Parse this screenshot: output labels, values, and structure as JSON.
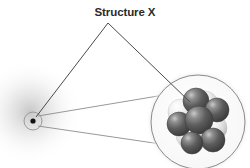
{
  "figure": {
    "title": "Structure X",
    "background_color": "#ffffff",
    "label_color": "#2b2b2b",
    "line_color": "#5a5a5a",
    "callout_line_color": "#4a4a4a",
    "magnifier_line_color": "#8c8c8c"
  },
  "atom": {
    "name": "atom",
    "electron_cloud": {
      "name": "electron-cloud",
      "center_x": 30,
      "center_y": 112,
      "radius": 52,
      "color": "#b8b8b8",
      "opacity": 0.55
    },
    "shell": {
      "name": "atom-outline-circle",
      "center_x": 33,
      "center_y": 121,
      "radius": 9,
      "stroke": "#9a9a9a",
      "stroke_width": 1
    },
    "nucleus_dot": {
      "name": "nucleus-dot",
      "center_x": 33,
      "center_y": 121,
      "radius": 2.6,
      "fill": "#111111"
    }
  },
  "magnifier": {
    "name": "magnified-nucleus",
    "circle": {
      "center_x": 198,
      "center_y": 122,
      "radius": 47,
      "stroke": "#8c8c8c",
      "stroke_width": 1,
      "fill": "#ffffff"
    },
    "halo_color": "#e9e9e9",
    "cone_lines": [
      {
        "x1": 38,
        "y1": 116,
        "x2": 176,
        "y2": 93
      },
      {
        "x1": 38,
        "y1": 126,
        "x2": 222,
        "y2": 153
      }
    ]
  },
  "nucleons": {
    "dark_color": "#4f4f4f",
    "dark_highlight": "#bdbdbd",
    "light_color": "#f2f2f2",
    "light_shadow": "#b0b0b0",
    "spheres": [
      {
        "name": "nucleon-light-1",
        "cx": 181,
        "cy": 112,
        "r": 13,
        "kind": "light"
      },
      {
        "name": "nucleon-light-2",
        "cx": 190,
        "cy": 135,
        "r": 14,
        "kind": "light"
      },
      {
        "name": "nucleon-light-3",
        "cx": 205,
        "cy": 104,
        "r": 13,
        "kind": "light"
      },
      {
        "name": "nucleon-light-4",
        "cx": 214,
        "cy": 128,
        "r": 13,
        "kind": "light"
      },
      {
        "name": "nucleon-dark-1",
        "cx": 196,
        "cy": 101,
        "r": 13,
        "kind": "dark"
      },
      {
        "name": "nucleon-dark-2",
        "cx": 179,
        "cy": 124,
        "r": 12,
        "kind": "dark"
      },
      {
        "name": "nucleon-dark-3",
        "cx": 217,
        "cy": 110,
        "r": 12,
        "kind": "dark"
      },
      {
        "name": "nucleon-dark-4",
        "cx": 199,
        "cy": 120,
        "r": 14,
        "kind": "dark"
      },
      {
        "name": "nucleon-dark-5",
        "cx": 213,
        "cy": 140,
        "r": 12,
        "kind": "dark"
      },
      {
        "name": "nucleon-dark-6",
        "cx": 192,
        "cy": 143,
        "r": 11,
        "kind": "dark"
      }
    ]
  },
  "callout": {
    "name": "label-leader-lines",
    "apex_x": 108,
    "apex_y": 23,
    "left_end_x": 36,
    "left_end_y": 117,
    "right_end_x": 190,
    "right_end_y": 102
  }
}
